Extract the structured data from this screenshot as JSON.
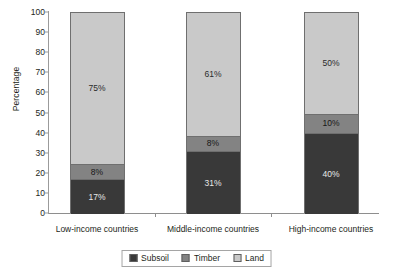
{
  "chart_data": {
    "type": "bar",
    "subtype": "stacked-bar-100",
    "title": "",
    "xlabel": "",
    "ylabel": "Percentage",
    "ylim": [
      0,
      100
    ],
    "yticks": [
      0,
      10,
      20,
      30,
      40,
      50,
      60,
      70,
      80,
      90,
      100
    ],
    "grid": false,
    "legend_position": "bottom-center",
    "categories": [
      "Low-income countries",
      "Middle-income countries",
      "High-income countries"
    ],
    "series": [
      {
        "name": "Subsoil",
        "color": "#393939",
        "values": [
          17,
          31,
          40
        ],
        "labels": [
          "17%",
          "31%",
          "40%"
        ]
      },
      {
        "name": "Timber",
        "color": "#838383",
        "values": [
          8,
          8,
          10
        ],
        "labels": [
          "8%",
          "8%",
          "10%"
        ]
      },
      {
        "name": "Land",
        "color": "#c9c9c9",
        "values": [
          75,
          61,
          50
        ],
        "labels": [
          "75%",
          "61%",
          "50%"
        ]
      }
    ]
  },
  "axis": {
    "y_label": "Percentage",
    "y_tick_labels": [
      "100",
      "90",
      "80",
      "70",
      "60",
      "50",
      "40",
      "30",
      "20",
      "10",
      "0"
    ]
  },
  "legend": {
    "items": [
      {
        "label": "Subsoil",
        "color": "#393939"
      },
      {
        "label": "Timber",
        "color": "#838383"
      },
      {
        "label": "Land",
        "color": "#c9c9c9"
      }
    ]
  }
}
